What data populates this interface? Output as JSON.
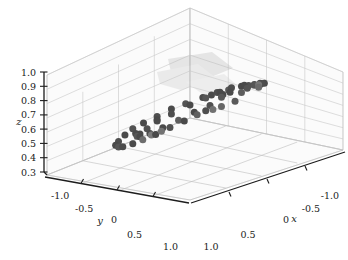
{
  "figure": {
    "type": "3d-scatter",
    "background_color": "#ffffff",
    "width": 348,
    "height": 260
  },
  "chart_data": {
    "type": "scatter",
    "projection": "3d",
    "title": "",
    "xlabel": "x",
    "ylabel": "y",
    "zlabel": "z",
    "xlim": [
      -1.0,
      1.0
    ],
    "ylim": [
      -1.0,
      1.0
    ],
    "zlim": [
      0.3,
      1.0
    ],
    "grid": true,
    "legend": null,
    "marker": {
      "shape": "circle",
      "size_px": 7,
      "colors": [
        "#4a4a4a",
        "#5a5a5a",
        "#6e6e6e",
        "#7e7e7e"
      ]
    },
    "xticks": [
      1.0,
      0.5,
      0,
      -0.5,
      -1.0
    ],
    "xticklabels": [
      "1.0",
      "0.5",
      "0",
      "-0.5",
      "-1.0"
    ],
    "yticks": [
      -1.0,
      -0.5,
      0,
      0.5,
      1.0
    ],
    "yticklabels": [
      "-1.0",
      "-0.5",
      "0",
      "0.5",
      "1.0"
    ],
    "zticks": [
      0.3,
      0.4,
      0.5,
      0.6,
      0.7,
      0.8,
      0.9,
      1.0
    ],
    "zticklabels": [
      "0.3",
      "0.4",
      "0.5",
      "0.6",
      "0.7",
      "0.8",
      "0.9",
      "1.0"
    ],
    "points": [
      {
        "x": -0.1,
        "y": 0.62,
        "z": 0.8,
        "c": "#5d5d5d"
      },
      {
        "x": 0.07,
        "y": 0.7,
        "z": 0.78,
        "c": "#5a5a5a"
      },
      {
        "x": 0.22,
        "y": 0.66,
        "z": 0.77,
        "c": "#676767"
      },
      {
        "x": 0.36,
        "y": 0.58,
        "z": 0.76,
        "c": "#4e4e4e"
      },
      {
        "x": -0.3,
        "y": 0.66,
        "z": 0.8,
        "c": "#6a6a6a"
      },
      {
        "x": -0.44,
        "y": 0.56,
        "z": 0.79,
        "c": "#4d4d4d"
      },
      {
        "x": -0.4,
        "y": 0.5,
        "z": 0.78,
        "c": "#555555"
      },
      {
        "x": -0.56,
        "y": 0.48,
        "z": 0.76,
        "c": "#4a4a4a"
      },
      {
        "x": -0.62,
        "y": 0.36,
        "z": 0.73,
        "c": "#505050"
      },
      {
        "x": -0.7,
        "y": 0.2,
        "z": 0.7,
        "c": "#4b4b4b"
      },
      {
        "x": -0.72,
        "y": 0.1,
        "z": 0.68,
        "c": "#535353"
      },
      {
        "x": -0.74,
        "y": -0.02,
        "z": 0.66,
        "c": "#4a4a4a"
      },
      {
        "x": -0.7,
        "y": -0.16,
        "z": 0.63,
        "c": "#585858"
      },
      {
        "x": -0.66,
        "y": -0.28,
        "z": 0.61,
        "c": "#4f4f4f"
      },
      {
        "x": -0.58,
        "y": -0.4,
        "z": 0.58,
        "c": "#4a4a4a"
      },
      {
        "x": -0.46,
        "y": -0.52,
        "z": 0.55,
        "c": "#545454"
      },
      {
        "x": -0.34,
        "y": -0.6,
        "z": 0.53,
        "c": "#4b4b4b"
      },
      {
        "x": -0.2,
        "y": -0.66,
        "z": 0.5,
        "c": "#4f4f4f"
      },
      {
        "x": -0.05,
        "y": -0.7,
        "z": 0.48,
        "c": "#4a4a4a"
      },
      {
        "x": 0.1,
        "y": -0.7,
        "z": 0.47,
        "c": "#525252"
      },
      {
        "x": 0.25,
        "y": -0.66,
        "z": 0.46,
        "c": "#4a4a4a"
      },
      {
        "x": 0.4,
        "y": -0.6,
        "z": 0.45,
        "c": "#4e4e4e"
      },
      {
        "x": 0.54,
        "y": -0.5,
        "z": 0.46,
        "c": "#4a4a4a"
      },
      {
        "x": 0.64,
        "y": -0.36,
        "z": 0.48,
        "c": "#565656"
      },
      {
        "x": 0.72,
        "y": -0.22,
        "z": 0.51,
        "c": "#4c4c4c"
      },
      {
        "x": 0.74,
        "y": -0.06,
        "z": 0.55,
        "c": "#4a4a4a"
      },
      {
        "x": 0.74,
        "y": 0.08,
        "z": 0.59,
        "c": "#6d6d6d"
      },
      {
        "x": 0.7,
        "y": 0.22,
        "z": 0.63,
        "c": "#4a4a4a"
      },
      {
        "x": 0.64,
        "y": 0.36,
        "z": 0.68,
        "c": "#515151"
      },
      {
        "x": 0.56,
        "y": 0.48,
        "z": 0.72,
        "c": "#4a4a4a"
      },
      {
        "x": 0.46,
        "y": 0.56,
        "z": 0.75,
        "c": "#606060"
      },
      {
        "x": -0.16,
        "y": 0.4,
        "z": 0.77,
        "c": "#4a4a4a"
      },
      {
        "x": 0.0,
        "y": 0.44,
        "z": 0.77,
        "c": "#585858"
      },
      {
        "x": -0.5,
        "y": 0.26,
        "z": 0.74,
        "c": "#4a4a4a"
      },
      {
        "x": -0.52,
        "y": 0.06,
        "z": 0.7,
        "c": "#4d4d4d"
      },
      {
        "x": -0.5,
        "y": -0.08,
        "z": 0.66,
        "c": "#4a4a4a"
      },
      {
        "x": -0.44,
        "y": -0.22,
        "z": 0.62,
        "c": "#555555"
      },
      {
        "x": -0.34,
        "y": -0.34,
        "z": 0.58,
        "c": "#4a4a4a"
      },
      {
        "x": -0.18,
        "y": -0.44,
        "z": 0.54,
        "c": "#4e4e4e"
      },
      {
        "x": -0.02,
        "y": -0.48,
        "z": 0.52,
        "c": "#4a4a4a"
      },
      {
        "x": 0.14,
        "y": -0.46,
        "z": 0.5,
        "c": "#525252"
      },
      {
        "x": 0.3,
        "y": -0.4,
        "z": 0.5,
        "c": "#4a4a4a"
      },
      {
        "x": 0.44,
        "y": -0.3,
        "z": 0.52,
        "c": "#575757"
      },
      {
        "x": 0.54,
        "y": -0.16,
        "z": 0.55,
        "c": "#4a4a4a"
      },
      {
        "x": 0.56,
        "y": 0.0,
        "z": 0.59,
        "c": "#4c4c4c"
      },
      {
        "x": 0.54,
        "y": 0.16,
        "z": 0.64,
        "c": "#4a4a4a"
      },
      {
        "x": 0.46,
        "y": 0.3,
        "z": 0.69,
        "c": "#5e5e5e"
      },
      {
        "x": 0.34,
        "y": 0.4,
        "z": 0.73,
        "c": "#4a4a4a"
      },
      {
        "x": 0.18,
        "y": 0.46,
        "z": 0.75,
        "c": "#4f4f4f"
      },
      {
        "x": -0.6,
        "y": -0.14,
        "z": 0.62,
        "c": "#4a4a4a"
      },
      {
        "x": -0.26,
        "y": 0.54,
        "z": 0.79,
        "c": "#545454"
      },
      {
        "x": -0.12,
        "y": -0.58,
        "z": 0.5,
        "c": "#4a4a4a"
      },
      {
        "x": 0.2,
        "y": -0.56,
        "z": 0.47,
        "c": "#4b4b4b"
      },
      {
        "x": 0.66,
        "y": 0.12,
        "z": 0.61,
        "c": "#7a7a7a"
      },
      {
        "x": -0.36,
        "y": 0.6,
        "z": 0.8,
        "c": "#767676"
      },
      {
        "x": 0.3,
        "y": 0.62,
        "z": 0.76,
        "c": "#717171"
      },
      {
        "x": -0.68,
        "y": 0.3,
        "z": 0.72,
        "c": "#4a4a4a"
      },
      {
        "x": 0.7,
        "y": 0.3,
        "z": 0.66,
        "c": "#737373"
      },
      {
        "x": -0.64,
        "y": -0.34,
        "z": 0.59,
        "c": "#4a4a4a"
      }
    ]
  }
}
